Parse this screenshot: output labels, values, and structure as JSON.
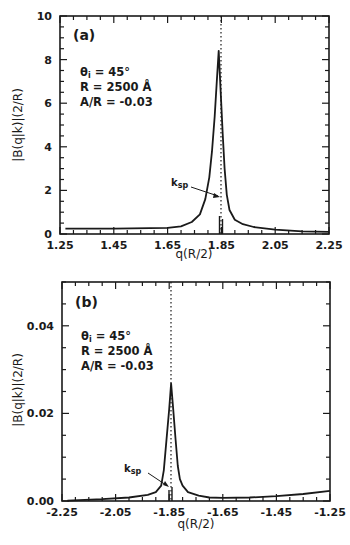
{
  "chart_data": [
    {
      "type": "line",
      "panel_label": "(a)",
      "xlabel": "q(R/2)",
      "ylabel": "|B(q|k)|(2/R)",
      "xlim": [
        1.25,
        2.25
      ],
      "ylim": [
        0,
        10
      ],
      "x_ticks": [
        "1.25",
        "1.45",
        "1.65",
        "1.85",
        "2.05",
        "2.25"
      ],
      "y_ticks": [
        "0",
        "2",
        "4",
        "6",
        "8",
        "10"
      ],
      "grid": false,
      "parameters": [
        "θi = 45°",
        "R = 2500 Å",
        "A/R = -0.03"
      ],
      "annotation": "ksp",
      "ksp_x": 1.84,
      "series": [
        {
          "name": "|B(q|k)|",
          "x": [
            1.27,
            1.45,
            1.65,
            1.7,
            1.74,
            1.77,
            1.79,
            1.805,
            1.815,
            1.825,
            1.833,
            1.84,
            1.847,
            1.855,
            1.862,
            1.87,
            1.88,
            1.9,
            1.93,
            1.97,
            2.05,
            2.15,
            2.25
          ],
          "y": [
            0.25,
            0.25,
            0.28,
            0.35,
            0.55,
            0.9,
            1.6,
            2.6,
            3.8,
            5.4,
            7.0,
            8.4,
            6.6,
            4.6,
            3.0,
            1.8,
            1.1,
            0.65,
            0.45,
            0.32,
            0.2,
            0.12,
            0.1
          ]
        }
      ]
    },
    {
      "type": "line",
      "panel_label": "(b)",
      "xlabel": "q(R/2)",
      "ylabel": "|B(q|k)|(2/R)",
      "xlim": [
        -2.25,
        -1.25
      ],
      "ylim": [
        0,
        0.05
      ],
      "x_ticks": [
        "-2.25",
        "-2.05",
        "-1.85",
        "-1.65",
        "-1.45",
        "-1.25"
      ],
      "y_ticks": [
        "0.00",
        "0.02",
        "0.04"
      ],
      "grid": false,
      "parameters": [
        "θi = 45°",
        "R = 2500 Å",
        "A/R = -0.03"
      ],
      "annotation": "ksp",
      "ksp_x": -1.84,
      "series": [
        {
          "name": "|B(q|k)|",
          "x": [
            -2.23,
            -2.1,
            -2.0,
            -1.93,
            -1.9,
            -1.88,
            -1.87,
            -1.86,
            -1.85,
            -1.843,
            -1.835,
            -1.826,
            -1.818,
            -1.81,
            -1.8,
            -1.78,
            -1.74,
            -1.7,
            -1.65,
            -1.55,
            -1.45,
            -1.35,
            -1.25
          ],
          "y": [
            0.0001,
            0.0004,
            0.0008,
            0.0014,
            0.002,
            0.0035,
            0.007,
            0.014,
            0.021,
            0.0268,
            0.021,
            0.014,
            0.008,
            0.005,
            0.0035,
            0.002,
            0.0012,
            0.0008,
            0.0007,
            0.0008,
            0.0011,
            0.0016,
            0.0023
          ]
        }
      ]
    }
  ],
  "panels": {
    "a": {
      "label": "(a)",
      "param_theta": "θi = 45°",
      "param_r": "R  = 2500 Å",
      "param_ar": "A/R = -0.03",
      "ksp": "ksp",
      "xlabel": "q(R/2)",
      "ylabel": "|B(q|k)|(2/R)",
      "x_ticks": [
        "1.25",
        "1.45",
        "1.65",
        "1.85",
        "2.05",
        "2.25"
      ],
      "y_ticks": [
        "0",
        "2",
        "4",
        "6",
        "8",
        "10"
      ]
    },
    "b": {
      "label": "(b)",
      "param_theta": "θi = 45°",
      "param_r": "R  = 2500 Å",
      "param_ar": "A/R = -0.03",
      "ksp": "ksp",
      "xlabel": "q(R/2)",
      "ylabel": "|B(q|k)|(2/R)",
      "x_ticks": [
        "-2.25",
        "-2.05",
        "-1.85",
        "-1.65",
        "-1.45",
        "-1.25"
      ],
      "y_ticks": [
        "0.00",
        "0.02",
        "0.04"
      ]
    }
  }
}
